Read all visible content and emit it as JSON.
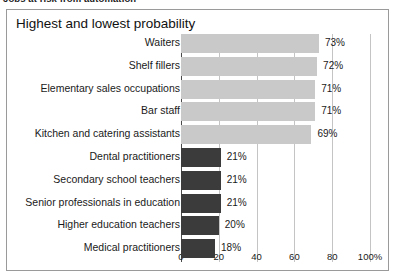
{
  "caption": {
    "text": "Jobs at risk from automation"
  },
  "chart_panel": {
    "title": "Highest and lowest probability"
  },
  "chart_data": {
    "type": "bar",
    "orientation": "horizontal",
    "title": "Highest and lowest probability",
    "xlabel": "",
    "ylabel": "",
    "xlim": [
      0,
      100
    ],
    "grid": true,
    "legend": false,
    "value_suffix": "%",
    "axis_ticks": [
      {
        "value": 0,
        "label": "0"
      },
      {
        "value": 20,
        "label": "20"
      },
      {
        "value": 40,
        "label": "40"
      },
      {
        "value": 60,
        "label": "60"
      },
      {
        "value": 80,
        "label": "80"
      },
      {
        "value": 100,
        "label": "100%"
      }
    ],
    "series": [
      {
        "name": "Highest probability",
        "color": "#c9c9c9"
      },
      {
        "name": "Lowest probability",
        "color": "#3b3b3b"
      }
    ],
    "categories": [
      "Waiters",
      "Shelf fillers",
      "Elementary sales occupations",
      "Bar staff",
      "Kitchen and catering assistants",
      "Dental practitioners",
      "Secondary school teachers",
      "Senior professionals in education",
      "Higher education teachers",
      "Medical practitioners"
    ],
    "values": [
      73,
      72,
      71,
      71,
      69,
      21,
      21,
      21,
      20,
      18
    ],
    "value_labels": [
      "73%",
      "72%",
      "71%",
      "71%",
      "69%",
      "21%",
      "21%",
      "21%",
      "20%",
      "18%"
    ],
    "groups": [
      "high",
      "high",
      "high",
      "high",
      "high",
      "low",
      "low",
      "low",
      "low",
      "low"
    ]
  }
}
